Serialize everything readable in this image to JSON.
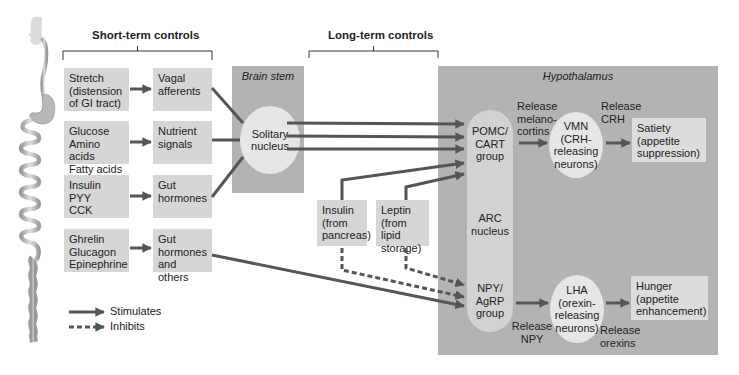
{
  "headings": {
    "short_term": "Short-term controls",
    "long_term": "Long-term controls"
  },
  "short_term": {
    "stimuli": [
      {
        "lines": [
          "Stretch",
          "(distension",
          "of GI tract)"
        ]
      },
      {
        "lines": [
          "Glucose",
          "Amino acids",
          "Fatty acids"
        ]
      },
      {
        "lines": [
          "Insulin",
          "PYY",
          "CCK"
        ]
      },
      {
        "lines": [
          "Ghrelin",
          "Glucagon",
          "Epinephrine"
        ]
      }
    ],
    "signals": [
      {
        "lines": [
          "Vagal",
          "afferents"
        ]
      },
      {
        "lines": [
          "Nutrient",
          "signals"
        ]
      },
      {
        "lines": [
          "Gut",
          "hormones"
        ]
      },
      {
        "lines": [
          "Gut",
          "hormones",
          "and others"
        ]
      }
    ]
  },
  "brain_stem": {
    "title": "Brain stem",
    "nucleus": [
      "Solitary",
      "nucleus"
    ]
  },
  "long_term": {
    "insulin": [
      "Insulin",
      "(from",
      "pancreas)"
    ],
    "leptin": [
      "Leptin",
      "(from lipid",
      "storage)"
    ]
  },
  "hypothalamus": {
    "title": "Hypothalamus",
    "pomc": [
      "POMC/",
      "CART",
      "group"
    ],
    "arc": [
      "ARC",
      "nucleus"
    ],
    "npy": [
      "NPY/",
      "AgRP",
      "group"
    ],
    "release_melanocortins": [
      "Release",
      "melano-",
      "cortins"
    ],
    "vmn": [
      "VMN",
      "(CRH-",
      "releasing",
      "neurons)"
    ],
    "release_crh": [
      "Release",
      "CRH"
    ],
    "satiety": [
      "Satiety",
      "(appetite",
      "suppression)"
    ],
    "release_npy": [
      "Release",
      "NPY"
    ],
    "lha": [
      "LHA",
      "(orexin-",
      "releasing",
      "neurons)"
    ],
    "release_orexins": [
      "Release",
      "orexins"
    ],
    "hunger": [
      "Hunger",
      "(appetite",
      "enhancement)"
    ]
  },
  "legend": {
    "stimulates": "Stimulates",
    "inhibits": "Inhibits"
  },
  "colors": {
    "box": "#d6d6d6",
    "region": "#b3b3b3",
    "ellipse": "#e6e6e6",
    "arrow": "#555555"
  }
}
